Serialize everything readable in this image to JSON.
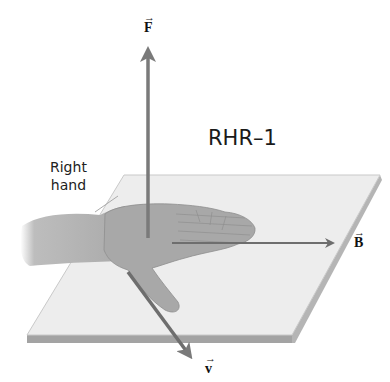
{
  "title": "RHR–1",
  "hand_label": [
    "Right",
    "hand"
  ],
  "vectors": {
    "F": {
      "symbol": "F",
      "arrow": "→"
    },
    "B": {
      "symbol": "B",
      "arrow": "→"
    },
    "v": {
      "symbol": "v",
      "arrow": "→"
    }
  },
  "colors": {
    "plane_top": "#ededed",
    "plane_edge": "#9a9a9a",
    "hand": "#a9a9a9",
    "vector": "#707070"
  }
}
